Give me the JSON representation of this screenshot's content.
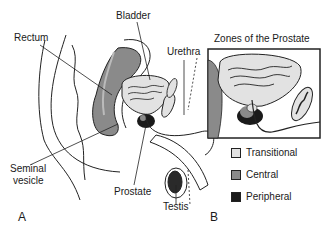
{
  "figure": {
    "panel_a": {
      "letter": "A",
      "labels": {
        "bladder": "Bladder",
        "rectum": "Rectum",
        "urethra": "Urethra",
        "seminal_vesicle_line1": "Seminal",
        "seminal_vesicle_line2": "vesicle",
        "prostate": "Prostate",
        "testis": "Testis"
      }
    },
    "panel_b": {
      "letter": "B",
      "title": "Zones of the Prostate",
      "legend": [
        {
          "label": "Transitional",
          "color": "#e2e2e2"
        },
        {
          "label": "Central",
          "color": "#8a8a8a"
        },
        {
          "label": "Peripheral",
          "color": "#1a1a1a"
        }
      ]
    }
  }
}
